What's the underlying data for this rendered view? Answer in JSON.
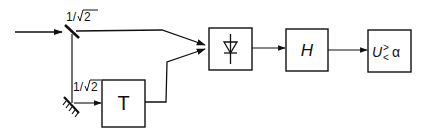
{
  "diagram": {
    "type": "block-diagram",
    "stroke_color": "#111111",
    "background": "#ffffff",
    "labels": {
      "splitter_coefficient": "1/",
      "splitter_coefficient_root": "2",
      "mirror_coefficient": "1/",
      "mirror_coefficient_root": "2"
    },
    "blocks": [
      {
        "id": "delay",
        "label": "T",
        "meaning": "delay element"
      },
      {
        "id": "detector",
        "label": "",
        "icon": "diode-icon",
        "meaning": "photodiode / rectifier"
      },
      {
        "id": "filter",
        "label": "H",
        "meaning": "filter"
      },
      {
        "id": "decision",
        "label": "U",
        "comparator_sign_top": ">",
        "comparator_sign_bottom": "<",
        "threshold": "α",
        "meaning": "threshold decision U ≷ α"
      }
    ],
    "components": [
      {
        "id": "beam-splitter",
        "coefficient": "1/√2"
      },
      {
        "id": "mirror",
        "coefficient": "1/√2"
      }
    ]
  }
}
